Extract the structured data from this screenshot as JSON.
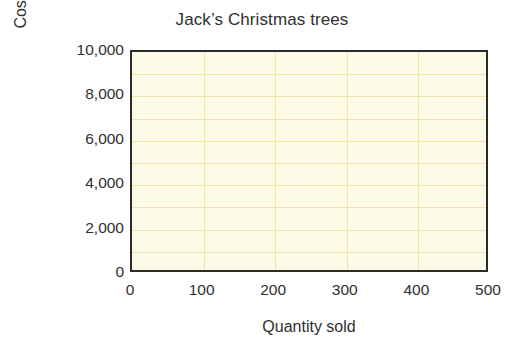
{
  "chart_data": {
    "type": "line",
    "title": "Jack’s Christmas trees",
    "xlabel": "Quantity sold",
    "ylabel": "Costs/revenue (£)",
    "xlim": [
      0,
      500
    ],
    "ylim": [
      0,
      10000
    ],
    "x_ticks": [
      0,
      100,
      200,
      300,
      400,
      500
    ],
    "x_tick_labels": [
      "0",
      "100",
      "200",
      "300",
      "400",
      "500"
    ],
    "y_ticks": [
      0,
      2000,
      4000,
      6000,
      8000,
      10000
    ],
    "y_tick_labels": [
      "0",
      "2,000",
      "4,000",
      "6,000",
      "8,000",
      "10,000"
    ],
    "grid": true,
    "grid_x_step": 100,
    "grid_y_step": 1000,
    "grid_x_values": [
      100,
      200,
      300,
      400
    ],
    "grid_y_values": [
      1000,
      2000,
      3000,
      4000,
      5000,
      6000,
      7000,
      8000,
      9000
    ],
    "legend": null,
    "legend_position": "none",
    "series": [],
    "annotations": [],
    "note": "Blank plotting grid — axes and gridlines only, no data series plotted.",
    "colors": {
      "plot_background": "#FDFBE8",
      "gridline": "#F0E3A8",
      "axis_frame": "#2B2B28",
      "text": "#2F2F2F",
      "page_background": "#FFFFFF"
    }
  }
}
